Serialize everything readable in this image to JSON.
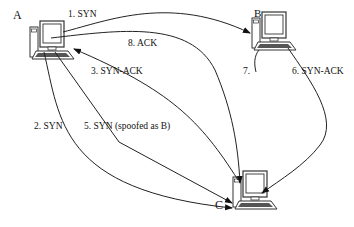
{
  "nodes": [
    {
      "id": "A",
      "label": "A"
    },
    {
      "id": "B",
      "label": "B"
    },
    {
      "id": "C",
      "label": "C"
    }
  ],
  "messages": [
    {
      "step": 1,
      "label": "1. SYN",
      "from": "A",
      "to": "B"
    },
    {
      "step": 2,
      "label": "2.  SYN",
      "from": "A",
      "to": "C"
    },
    {
      "step": 3,
      "label": "3.    SYN-ACK",
      "from": "C",
      "to": "A"
    },
    {
      "step": 5,
      "label": "5.   SYN (spoofed as B)",
      "from": "A",
      "to": "C"
    },
    {
      "step": 6,
      "label": "6. SYN-ACK",
      "from": "B",
      "to": "C"
    },
    {
      "step": 7,
      "label": "7.",
      "from": "B",
      "to": ""
    },
    {
      "step": 8,
      "label": "8. ACK",
      "from": "A",
      "to": "C"
    }
  ],
  "colors": {
    "line": "#222222",
    "monitor": "#333333",
    "background": "#ffffff"
  }
}
